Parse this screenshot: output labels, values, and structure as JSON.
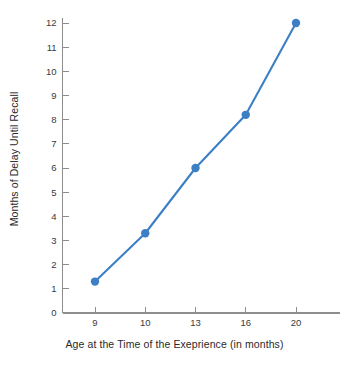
{
  "chart_data": {
    "type": "line",
    "title": "",
    "xlabel": "Age at the Time of the Exeprience (in months)",
    "ylabel": "Months of Delay Until Recall",
    "categories": [
      "9",
      "10",
      "13",
      "16",
      "20"
    ],
    "x": [
      9,
      10,
      13,
      16,
      20
    ],
    "values": [
      1.3,
      3.3,
      6.0,
      8.2,
      12.0
    ],
    "series": [
      {
        "name": "Months of Delay Until Recall",
        "values": [
          1.3,
          3.3,
          6.0,
          8.2,
          12.0
        ]
      }
    ],
    "ylim": [
      0,
      12
    ],
    "yticks": [
      0,
      1,
      2,
      3,
      4,
      5,
      6,
      7,
      8,
      9,
      10,
      11,
      12
    ],
    "ytick_labels": [
      "0",
      "1",
      "2",
      "3",
      "4",
      "5",
      "6",
      "7",
      "8",
      "9",
      "10",
      "11",
      "12"
    ],
    "xtick_labels": [
      "9",
      "10",
      "13",
      "16",
      "20"
    ],
    "grid": false,
    "legend": false,
    "legend_position": "none",
    "marker": "circle",
    "colors": {
      "series": "#3d7fc4",
      "marker": "#3d7fc4",
      "axis": "#8d8d8d",
      "tick_text": "#3a3a3a",
      "label_text": "#2a2a2a",
      "background": "#ffffff"
    }
  }
}
